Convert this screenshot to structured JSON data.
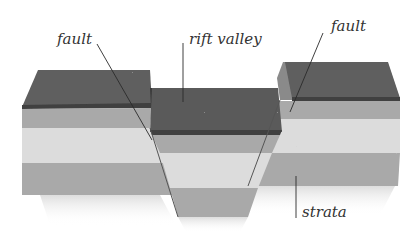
{
  "diagram": {
    "labels": {
      "fault_left": "fault",
      "rift_valley": "rift valley",
      "fault_right": "fault",
      "strata": "strata"
    },
    "colors": {
      "top_surface": "#5e5e5e",
      "top_surface_edge": "#3f3f3f",
      "side_face": "#8a8a8a",
      "stratum_medium": "#a9a9a9",
      "stratum_light": "#dcdcdc",
      "leader_line": "#2a2a2a"
    }
  }
}
